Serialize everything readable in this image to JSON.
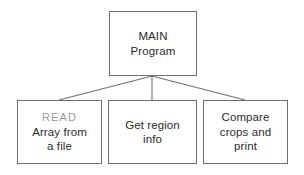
{
  "diagram": {
    "type": "hierarchy-tree",
    "background_color": "#ffffff",
    "line_color": "#6e6e6e",
    "text_color": "#2b2b2b",
    "muted_text_color": "#9a9a9a",
    "root": {
      "name": "main-program",
      "line1": "MAIN",
      "line2": "Program"
    },
    "children": [
      {
        "name": "read-array",
        "line1": "READ",
        "line2": "Array from",
        "line3": "a file"
      },
      {
        "name": "get-region-info",
        "line1": "Get region",
        "line2": "info"
      },
      {
        "name": "compare-crops",
        "line1": "Compare",
        "line2": "crops and",
        "line3": "print"
      }
    ],
    "connectors": [
      {
        "name": "root-to-read",
        "from_x": 152,
        "from_y": 76,
        "to_x": 59,
        "to_y": 100
      },
      {
        "name": "root-to-region",
        "from_x": 152,
        "from_y": 76,
        "to_x": 152,
        "to_y": 100
      },
      {
        "name": "root-to-compare",
        "from_x": 152,
        "from_y": 76,
        "to_x": 245,
        "to_y": 100
      }
    ]
  }
}
